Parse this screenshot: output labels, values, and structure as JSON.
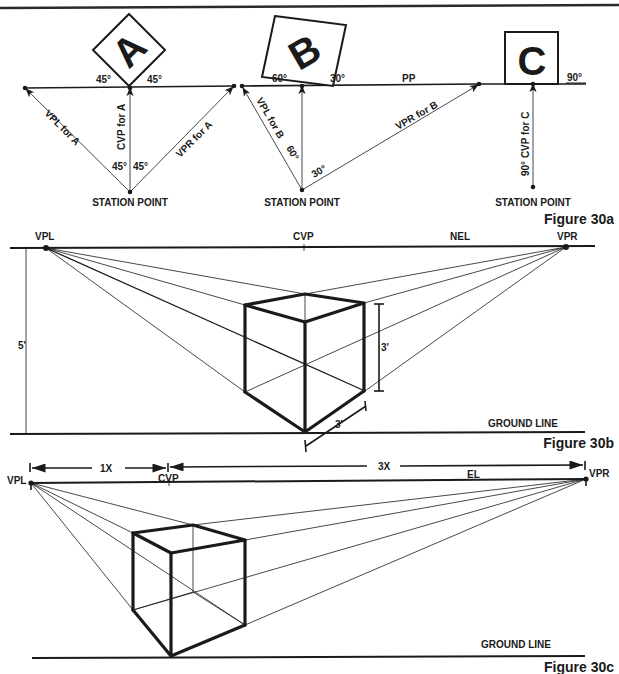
{
  "figures": {
    "fig30a": {
      "caption": "Figure 30a",
      "picture_plane_label": "PP",
      "groups": [
        {
          "letter": "A",
          "angle_left": "45°",
          "angle_right": "45°",
          "sp_angle_left": "45°",
          "sp_angle_right": "45°",
          "vpl_label": "VPL for A",
          "cvp_label": "CVP for A",
          "vpr_label": "VPR for A",
          "station_point": "STATION POINT"
        },
        {
          "letter": "B",
          "angle_left": "60°",
          "angle_right": "30°",
          "sp_angle_left": "60°",
          "sp_angle_right": "30°",
          "vpl_label": "VPL for B",
          "vpr_label": "VPR for B",
          "station_point": "STATION POINT"
        },
        {
          "letter": "C",
          "angle_right": "90°",
          "cvp_label": "90° CVP for C",
          "station_point": "STATION POINT"
        }
      ]
    },
    "fig30b": {
      "caption": "Figure 30b",
      "vpl": "VPL",
      "cvp": "CVP",
      "horizon": "NEL",
      "vpr": "VPR",
      "eye_height": "5'",
      "cube_height": "3'",
      "cube_depth": "3'",
      "ground_line": "GROUND LINE"
    },
    "fig30c": {
      "caption": "Figure 30c",
      "vpl": "VPL",
      "cvp": "CVP",
      "horizon": "EL",
      "vpr": "VPR",
      "left_span": "1X",
      "right_span": "3X",
      "ground_line": "GROUND LINE"
    }
  }
}
